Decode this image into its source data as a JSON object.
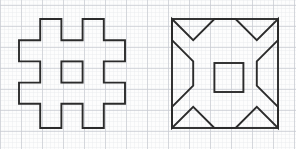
{
  "page": {
    "width": 296,
    "height": 149,
    "background_color": "#fdfdfd"
  },
  "grid": {
    "name": "graph-paper-grid",
    "minor": {
      "spacing": 4.2,
      "color": "#e9eaee",
      "stroke_width": 0.45,
      "visible": true
    },
    "major": {
      "spacing": 21,
      "color": "#c8cbd2",
      "stroke_width": 0.7,
      "visible": true,
      "origin_x": 0,
      "origin_y": 5
    }
  },
  "ink": {
    "stroke_color": "#2b2b2b",
    "stroke_width": 1.9,
    "fill": "none",
    "linejoin": "miter"
  },
  "figures": [
    {
      "name": "stepped-square-figure",
      "label": "Figure 1",
      "description": "Square outline with square notches cut at each corner and at each edge midpoint, plus an isolated small square at the center.",
      "bounds": {
        "x": 19,
        "y": 19,
        "width": 106,
        "height": 109
      },
      "cell": 21.2,
      "outline_points": "19,40.2 40.2,40.2 40.2,19 61.4,19 61.4,40.2 82.6,40.2 82.6,19 103.8,19 103.8,40.2 125,40.2 125,61.4 103.8,61.4 103.8,82.6 125,82.6 125,103.8 103.8,103.8 103.8,128 82.6,128 82.6,103.8 61.4,103.8 61.4,128 40.2,128 40.2,103.8 19,103.8 19,82.6 40.2,82.6 40.2,61.4 19,61.4",
      "inner_square": {
        "x": 61.4,
        "y": 61.4,
        "width": 21.2,
        "height": 21.2
      }
    },
    {
      "name": "star-in-square-figure",
      "label": "Figure 2",
      "description": "Square frame containing a four-pointed concave star whose points reach the square's corners, plus a small square at the center.",
      "bounds": {
        "x": 172,
        "y": 19,
        "width": 106,
        "height": 109
      },
      "frame": {
        "x": 172,
        "y": 19,
        "width": 106,
        "height": 109
      },
      "star_points": "172,19 193.2,40.2 214.4,19 235.6,19 256.8,40.2 278,19 278,40.2 256.8,61.4 256.8,85.6 278,106.8 278,128 256.8,106.8 235.6,128 214.4,128 193.2,106.8 172,128 172,106.8 193.2,85.6 193.2,61.4 172,40.2",
      "inner_square": {
        "x": 214.4,
        "y": 63,
        "width": 29,
        "height": 29
      }
    }
  ]
}
